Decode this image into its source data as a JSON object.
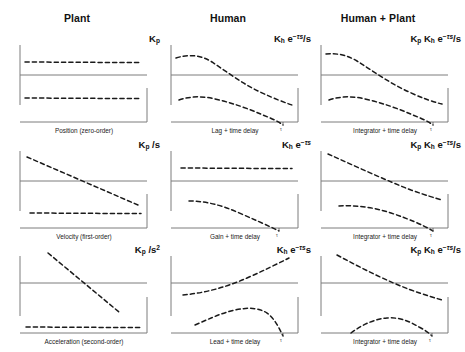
{
  "figure": {
    "background_color": "#ffffff",
    "curve_color": "#1a1a1a",
    "axis_color": "#7d7d7d",
    "columns": [
      {
        "id": "plant",
        "label": "Plant",
        "center_x": 77
      },
      {
        "id": "human",
        "label": "Human",
        "center_x": 228
      },
      {
        "id": "human-plant",
        "label": "Human + Plant",
        "center_x": 378
      }
    ],
    "rows": [
      {
        "id": "zero-order",
        "label": "Position (zero-order)"
      },
      {
        "id": "first-order",
        "label": "Velocity (first-order)"
      },
      {
        "id": "second-order",
        "label": "Acceleration (second-order)"
      }
    ]
  },
  "panels": [
    {
      "id": "plant-zero-order",
      "row": "zero-order",
      "column": "plant",
      "xlabel": "Position (zero-order)",
      "formula": {
        "gain": "K",
        "gain_sub": "p",
        "exp": "",
        "exp_sup": "",
        "denominator": ""
      },
      "formula_text": "K_p",
      "magnitude": {
        "shape": "flat",
        "description": "constant magnitude, zero slope"
      },
      "phase": {
        "shape": "flat",
        "description": "constant phase, zero slope"
      }
    },
    {
      "id": "human-zero-order",
      "row": "zero-order",
      "column": "human",
      "xlabel": "Lag + time delay",
      "formula_text": "K_h e^-ts / s",
      "magnitude": {
        "shape": "rolloff",
        "description": "flat then falling -20 dB/dec"
      },
      "phase": {
        "shape": "falling-accelerating",
        "description": "gentle then steep phase lag"
      }
    },
    {
      "id": "human-plant-zero-order",
      "row": "zero-order",
      "column": "human-plant",
      "xlabel": "Integrator + time delay",
      "formula_text": "K_p K_h e^-ts / s",
      "magnitude": {
        "shape": "rolloff",
        "description": "flat then falling -20 dB/dec"
      },
      "phase": {
        "shape": "falling-accelerating",
        "description": "gentle then steep phase lag"
      }
    },
    {
      "id": "plant-first-order",
      "row": "first-order",
      "column": "plant",
      "xlabel": "Velocity (first-order)",
      "formula_text": "K_p / s",
      "magnitude": {
        "shape": "linear-down",
        "description": "constant -20 dB/dec slope"
      },
      "phase": {
        "shape": "flat",
        "description": "constant -90 deg phase"
      }
    },
    {
      "id": "human-first-order",
      "row": "first-order",
      "column": "human",
      "xlabel": "Gain + time delay",
      "formula_text": "K_h e^-ts",
      "magnitude": {
        "shape": "flat",
        "description": "constant gain magnitude"
      },
      "phase": {
        "shape": "falling-accelerating",
        "description": "phase lag growing with frequency"
      }
    },
    {
      "id": "human-plant-first-order",
      "row": "first-order",
      "column": "human-plant",
      "xlabel": "Integrator + time delay",
      "formula_text": "K_p K_h e^-ts / s",
      "magnitude": {
        "shape": "linear-down",
        "description": "constant -20 dB/dec slope"
      },
      "phase": {
        "shape": "falling-accelerating",
        "description": "gentle then steep phase lag"
      }
    },
    {
      "id": "plant-second-order",
      "row": "second-order",
      "column": "plant",
      "xlabel": "Acceleration (second-order)",
      "formula_text": "K_p / s^2",
      "magnitude": {
        "shape": "linear-down-steep",
        "description": "constant -40 dB/dec slope"
      },
      "phase": {
        "shape": "flat",
        "description": "constant -180 deg phase"
      }
    },
    {
      "id": "human-second-order",
      "row": "second-order",
      "column": "human",
      "xlabel": "Lead + time delay",
      "formula_text": "K_h e^-ts s",
      "magnitude": {
        "shape": "linear-up",
        "description": "rising +20 dB/dec slope"
      },
      "phase": {
        "shape": "hump-then-drop",
        "description": "phase lead rising to peak then falling"
      }
    },
    {
      "id": "human-plant-second-order",
      "row": "second-order",
      "column": "human-plant",
      "xlabel": "Integrator + time delay",
      "formula_text": "K_p K_h e^-ts / s",
      "magnitude": {
        "shape": "linear-down",
        "description": "constant -20 dB/dec slope"
      },
      "phase": {
        "shape": "hump-then-drop",
        "description": "phase rising to peak then falling"
      }
    }
  ]
}
